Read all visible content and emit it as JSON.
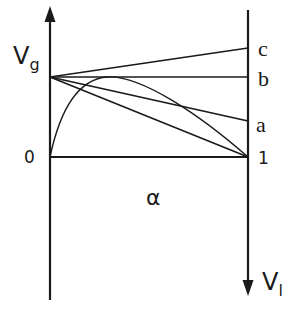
{
  "diagram": {
    "left_axis_label": "V",
    "left_axis_subscript": "g",
    "right_axis_label": "V",
    "right_axis_subscript": "l",
    "x_axis_label": "α",
    "origin_label": "0",
    "end_label": "1",
    "line_labels": [
      "c",
      "b",
      "a"
    ],
    "colors": {
      "stroke": "#1a1a1a",
      "background": "#ffffff"
    }
  }
}
